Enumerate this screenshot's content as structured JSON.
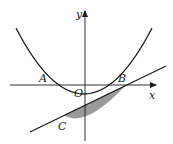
{
  "figure": {
    "type": "parabola-line-intersection",
    "axes": {
      "x_label": "x",
      "y_label": "y",
      "origin_label": "O"
    },
    "points": {
      "A": "A",
      "B": "B",
      "C": "C"
    },
    "colors": {
      "stroke": "#1a1a1a",
      "shade": "#9a9a9a",
      "background": "#ffffff"
    }
  }
}
